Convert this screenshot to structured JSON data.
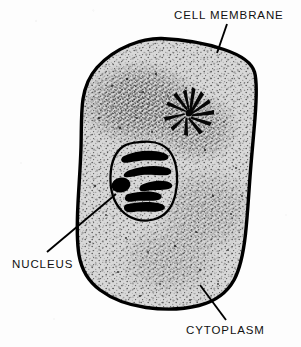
{
  "figure": {
    "kind": "biology-diagram",
    "background_color": "#fdfdfd",
    "ink_color": "#000000",
    "cytoplasm_fill": "#d6d6d6"
  },
  "labels": [
    {
      "id": "cell-membrane",
      "text": "CELL MEMBRANE",
      "position": "top-right",
      "leader_from": "227,24",
      "leader_to": "217,53"
    },
    {
      "id": "nucleus",
      "text": "NUCLEUS",
      "position": "bottom-left",
      "leader_from": "47,252",
      "leader_to": "116,194"
    },
    {
      "id": "cytoplasm",
      "text": "CYTOPLASM",
      "position": "bottom-right",
      "leader_from": "226,320",
      "leader_to": "200,285"
    }
  ],
  "structures": [
    {
      "id": "cell-membrane-outline",
      "name": "cell membrane",
      "description": "thick irregular closed outline enclosing the whole cell"
    },
    {
      "id": "cytoplasm-region",
      "name": "cytoplasm",
      "description": "light grey stippled interior of the cell"
    },
    {
      "id": "nucleus-outline",
      "name": "nucleus",
      "description": "oval outlined body left of centre containing dark chromosomes"
    },
    {
      "id": "chromosomes",
      "name": "chromosomes",
      "description": "five thick dark curved bars inside the nucleus"
    },
    {
      "id": "aster",
      "name": "aster / centrosome",
      "description": "dark star burst of radiating spokes upper right of the nucleus"
    }
  ]
}
